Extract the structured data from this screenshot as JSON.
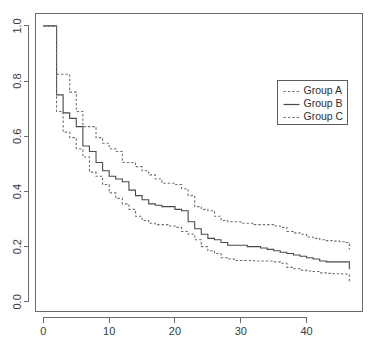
{
  "chart_data": {
    "type": "line",
    "title": "",
    "subtitle": "",
    "xlabel": "",
    "ylabel": "",
    "xlim": [
      -1.2,
      48.5
    ],
    "ylim": [
      -0.035,
      1.045
    ],
    "grid": false,
    "step_style": "post",
    "legend": {
      "position": "top-right",
      "entries": [
        {
          "label": "Group A",
          "style": "dashed"
        },
        {
          "label": "Group B",
          "style": "solid"
        },
        {
          "label": "Group C",
          "style": "dashed"
        }
      ]
    },
    "xticks": [
      0,
      10,
      20,
      30,
      40
    ],
    "xticklabels": [
      "0",
      "10",
      "20",
      "30",
      "40"
    ],
    "yticks": [
      0.0,
      0.2,
      0.4,
      0.6,
      0.8,
      1.0
    ],
    "yticklabels": [
      "0.0",
      "0.2",
      "0.4",
      "0.6",
      "0.8",
      "1.0"
    ],
    "series": [
      {
        "name": "Group A",
        "style": "dashed",
        "role": "upper-confidence-band",
        "x": [
          0,
          1,
          2,
          3,
          4,
          5,
          6,
          7,
          8,
          9,
          10,
          11,
          12,
          13,
          14,
          15,
          16,
          17,
          18,
          19,
          20,
          21,
          22,
          23,
          24,
          25,
          26,
          27,
          28,
          29,
          30,
          31,
          32,
          33,
          34,
          35,
          36,
          37,
          38,
          39,
          40,
          41,
          42,
          43,
          44,
          45,
          46,
          46.5
        ],
        "y": [
          1.0,
          1.0,
          0.825,
          0.825,
          0.76,
          0.69,
          0.635,
          0.635,
          0.595,
          0.575,
          0.555,
          0.545,
          0.505,
          0.505,
          0.49,
          0.475,
          0.46,
          0.445,
          0.43,
          0.43,
          0.425,
          0.41,
          0.385,
          0.345,
          0.335,
          0.33,
          0.31,
          0.295,
          0.29,
          0.29,
          0.285,
          0.285,
          0.28,
          0.28,
          0.28,
          0.275,
          0.27,
          0.255,
          0.25,
          0.245,
          0.235,
          0.23,
          0.225,
          0.222,
          0.22,
          0.218,
          0.215,
          0.19
        ]
      },
      {
        "name": "Group B",
        "style": "solid",
        "role": "estimate",
        "x": [
          0,
          1,
          2,
          3,
          4,
          5,
          6,
          7,
          8,
          9,
          10,
          11,
          12,
          13,
          14,
          15,
          16,
          17,
          18,
          19,
          20,
          21,
          22,
          23,
          24,
          25,
          26,
          27,
          28,
          29,
          30,
          31,
          32,
          33,
          34,
          35,
          36,
          37,
          38,
          39,
          40,
          41,
          42,
          43,
          44,
          45,
          46,
          46.5
        ],
        "y": [
          1.0,
          1.0,
          0.75,
          0.685,
          0.665,
          0.635,
          0.565,
          0.545,
          0.505,
          0.475,
          0.455,
          0.445,
          0.435,
          0.405,
          0.385,
          0.37,
          0.355,
          0.35,
          0.345,
          0.345,
          0.335,
          0.33,
          0.29,
          0.265,
          0.245,
          0.23,
          0.225,
          0.215,
          0.205,
          0.205,
          0.205,
          0.2,
          0.2,
          0.195,
          0.19,
          0.185,
          0.18,
          0.175,
          0.17,
          0.165,
          0.16,
          0.155,
          0.148,
          0.145,
          0.145,
          0.145,
          0.145,
          0.118
        ]
      },
      {
        "name": "Group C",
        "style": "dashed",
        "role": "lower-confidence-band",
        "x": [
          0,
          1,
          2,
          3,
          4,
          5,
          6,
          7,
          8,
          9,
          10,
          11,
          12,
          13,
          14,
          15,
          16,
          17,
          18,
          19,
          20,
          21,
          22,
          23,
          24,
          25,
          26,
          27,
          28,
          29,
          30,
          31,
          32,
          33,
          34,
          35,
          36,
          37,
          38,
          39,
          40,
          41,
          42,
          43,
          44,
          45,
          46,
          46.5
        ],
        "y": [
          1.0,
          1.0,
          0.69,
          0.615,
          0.595,
          0.555,
          0.525,
          0.47,
          0.455,
          0.425,
          0.395,
          0.375,
          0.355,
          0.335,
          0.31,
          0.295,
          0.285,
          0.28,
          0.28,
          0.275,
          0.27,
          0.255,
          0.245,
          0.225,
          0.2,
          0.185,
          0.175,
          0.16,
          0.155,
          0.15,
          0.15,
          0.15,
          0.148,
          0.148,
          0.148,
          0.145,
          0.14,
          0.125,
          0.12,
          0.115,
          0.112,
          0.11,
          0.105,
          0.103,
          0.102,
          0.101,
          0.1,
          0.075
        ]
      }
    ],
    "colors": {
      "solid_line": "#4a4a4a",
      "dashed_line": "#6f6f6f",
      "axis": "#6b6b6b",
      "text": "#3a3a3a",
      "background": "#ffffff"
    }
  }
}
